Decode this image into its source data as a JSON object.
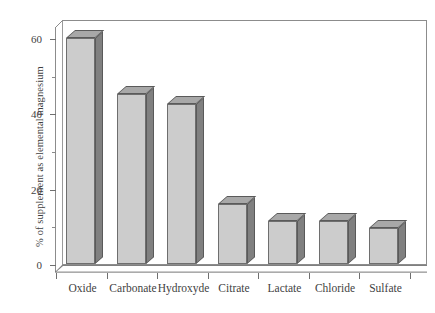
{
  "chart_data": {
    "type": "bar",
    "title": "",
    "xlabel": "",
    "ylabel": "% of supplement as elemental magnesium",
    "categories": [
      "Oxide",
      "Carbonate",
      "Hydroxyde",
      "Citrate",
      "Lactate",
      "Chloride",
      "Sulfate"
    ],
    "values": [
      60,
      45,
      42.5,
      16,
      11.5,
      11.5,
      9.5
    ],
    "ylim": [
      0,
      65
    ],
    "yticks_major": [
      0,
      20,
      40,
      60
    ],
    "yticks_minor": [
      10,
      30,
      50
    ],
    "ytick_labels": [
      "0",
      "20",
      "40",
      "60"
    ],
    "grid": false,
    "legend": null,
    "style": "3d-bar",
    "colors": {
      "bar_front": "#cccccc",
      "bar_side": "#808080",
      "bar_top": "#a8a8a8",
      "bar_edge": "#6e6e6e",
      "axis": "#8c8c8c",
      "text": "#3f3f3f",
      "background": "#ffffff"
    }
  },
  "axis": {
    "y_title": "% of supplement as elemental magnesium",
    "y_labels": [
      "60",
      "40",
      "20",
      "0"
    ]
  },
  "bars": [
    {
      "label": "Oxide",
      "value": 60
    },
    {
      "label": "Carbonate",
      "value": 45
    },
    {
      "label": "Hydroxyde",
      "value": 42.5
    },
    {
      "label": "Citrate",
      "value": 16
    },
    {
      "label": "Lactate",
      "value": 11.5
    },
    {
      "label": "Chloride",
      "value": 11.5
    },
    {
      "label": "Sulfate",
      "value": 9.5
    }
  ]
}
